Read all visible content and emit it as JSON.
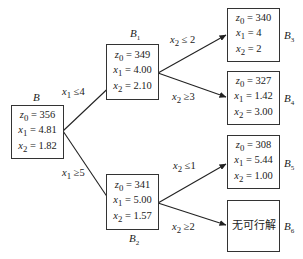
{
  "nodes": {
    "B": {
      "label": "B",
      "sub": "",
      "z0": "356",
      "x1": "4.81",
      "x2": "1.82"
    },
    "B1": {
      "label": "B",
      "sub": "1",
      "z0": "349",
      "x1": "4.00",
      "x2": "2.10"
    },
    "B2": {
      "label": "B",
      "sub": "2",
      "z0": "341",
      "x1": "5.00",
      "x2": "1.57"
    },
    "B3": {
      "label": "B",
      "sub": "3",
      "z0": "340",
      "x1": "4",
      "x2": "2"
    },
    "B4": {
      "label": "B",
      "sub": "4",
      "z0": "327",
      "x1": "1.42",
      "x2": "3.00"
    },
    "B5": {
      "label": "B",
      "sub": "5",
      "z0": "308",
      "x1": "5.44",
      "x2": "1.00"
    },
    "B6": {
      "label": "B",
      "sub": "6",
      "text": "无可行解"
    }
  },
  "edges": {
    "B_B1": {
      "var": "x",
      "sub": "1",
      "op": "≤",
      "val": "4"
    },
    "B_B2": {
      "var": "x",
      "sub": "1",
      "op": "≥",
      "val": "5"
    },
    "B1_B3": {
      "var": "x",
      "sub": "2",
      "op": "≤",
      "val": "2"
    },
    "B1_B4": {
      "var": "x",
      "sub": "2",
      "op": "≥",
      "val": "3"
    },
    "B2_B5": {
      "var": "x",
      "sub": "2",
      "op": "≤",
      "val": "1"
    },
    "B2_B6": {
      "var": "x",
      "sub": "2",
      "op": "≥",
      "val": "2"
    }
  },
  "var_names": {
    "z0": "z",
    "z0_sub": "0",
    "x1": "x",
    "x1_sub": "1",
    "x2": "x",
    "x2_sub": "2",
    "eq": " = "
  }
}
